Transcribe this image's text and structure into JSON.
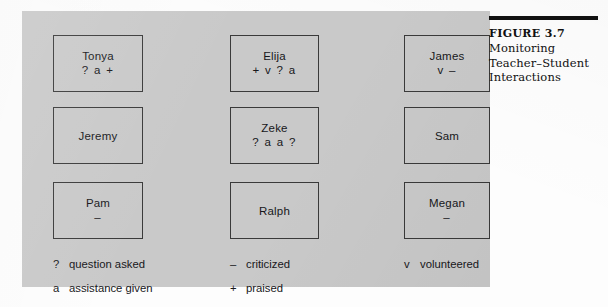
{
  "figure": {
    "caption_number": "FIGURE 3.7",
    "caption_lines": [
      "Monitoring",
      "Teacher–Student",
      "Interactions"
    ],
    "panel_color": "#c9c9c9",
    "rule_color": "#111111"
  },
  "students": [
    {
      "name": "Tonya",
      "codes": "? a +",
      "column": 1,
      "row": 1
    },
    {
      "name": "Jeremy",
      "codes": "",
      "column": 1,
      "row": 2
    },
    {
      "name": "Pam",
      "codes": "–",
      "column": 1,
      "row": 3
    },
    {
      "name": "Elija",
      "codes": "+ v ? a",
      "column": 2,
      "row": 1
    },
    {
      "name": "Zeke",
      "codes": "? a a ?",
      "column": 2,
      "row": 2
    },
    {
      "name": "Ralph",
      "codes": "",
      "column": 2,
      "row": 3
    },
    {
      "name": "James",
      "codes": "v –",
      "column": 3,
      "row": 1
    },
    {
      "name": "Sam",
      "codes": "",
      "column": 3,
      "row": 2
    },
    {
      "name": "Megan",
      "codes": "–",
      "column": 3,
      "row": 3
    }
  ],
  "legend": [
    {
      "symbol": "?",
      "label": "question asked",
      "column": 1,
      "row": 1
    },
    {
      "symbol": "a",
      "label": "assistance given",
      "column": 1,
      "row": 2
    },
    {
      "symbol": "–",
      "label": "criticized",
      "column": 2,
      "row": 1
    },
    {
      "symbol": "+",
      "label": "praised",
      "column": 2,
      "row": 2
    },
    {
      "symbol": "v",
      "label": "volunteered",
      "column": 3,
      "row": 1
    }
  ]
}
